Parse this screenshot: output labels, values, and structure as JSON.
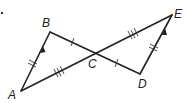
{
  "diagram": {
    "type": "geometry",
    "colors": {
      "stroke": "#222222",
      "background": "#ffffff"
    },
    "points": {
      "A": {
        "label": "A",
        "x": 21,
        "y": 91
      },
      "B": {
        "label": "B",
        "x": 50,
        "y": 32
      },
      "C": {
        "label": "C",
        "x": 93,
        "y": 53
      },
      "D": {
        "label": "D",
        "x": 140,
        "y": 74
      },
      "E": {
        "label": "E",
        "x": 172,
        "y": 15
      }
    },
    "segments": [
      {
        "name": "AB",
        "from": "A",
        "to": "B",
        "ticks": 2,
        "arrow": 1
      },
      {
        "name": "BC",
        "from": "B",
        "to": "C",
        "ticks": 1
      },
      {
        "name": "CE",
        "from": "C",
        "to": "E",
        "ticks": 3
      },
      {
        "name": "AC",
        "from": "A",
        "to": "C",
        "ticks": 3
      },
      {
        "name": "CD",
        "from": "C",
        "to": "D",
        "ticks": 1
      },
      {
        "name": "DE",
        "from": "D",
        "to": "E",
        "ticks": 2,
        "arrow": 1
      }
    ],
    "labels": {
      "A": "A",
      "B": "B",
      "C": "C",
      "D": "D",
      "E": "E"
    }
  }
}
